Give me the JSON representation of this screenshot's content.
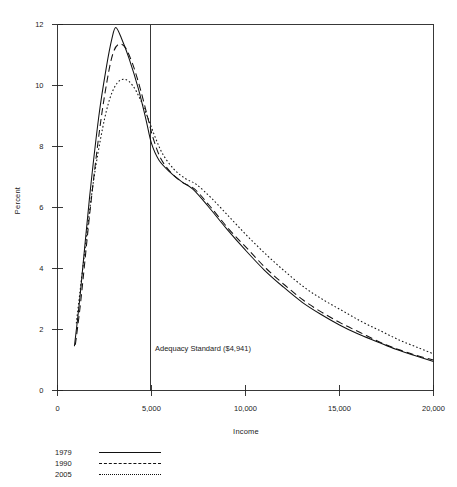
{
  "chart_data": {
    "type": "line",
    "title": "",
    "xlabel": "Income",
    "ylabel": "Percent",
    "xlim": [
      0,
      20000
    ],
    "ylim": [
      0,
      12
    ],
    "grid": false,
    "legend_position": "below-left",
    "x_ticks": [
      {
        "value": 0,
        "label": "0"
      },
      {
        "value": 5000,
        "label": "5,000"
      },
      {
        "value": 10000,
        "label": "10,000"
      },
      {
        "value": 15000,
        "label": "15,000"
      },
      {
        "value": 20000,
        "label": "20,000"
      }
    ],
    "y_ticks": [
      {
        "value": 0,
        "label": "0"
      },
      {
        "value": 2,
        "label": "2"
      },
      {
        "value": 4,
        "label": "4"
      },
      {
        "value": 6,
        "label": "6"
      },
      {
        "value": 8,
        "label": "8"
      },
      {
        "value": 10,
        "label": "10"
      },
      {
        "value": 12,
        "label": "12"
      }
    ],
    "annotations": [
      {
        "name": "adequacy-standard",
        "text": "Adequacy Standard ($4,941)",
        "x": 4941,
        "type": "vertical-line-with-label",
        "label_x": 5300,
        "label_y": 1.45
      }
    ],
    "series": [
      {
        "name": "1979",
        "style": "solid",
        "color": "#111111",
        "points": [
          [
            900,
            1.45
          ],
          [
            1200,
            3.1
          ],
          [
            1700,
            6.3
          ],
          [
            2200,
            9.0
          ],
          [
            2600,
            10.6
          ],
          [
            2900,
            11.55
          ],
          [
            3100,
            11.9
          ],
          [
            3400,
            11.55
          ],
          [
            3800,
            10.9
          ],
          [
            4300,
            9.9
          ],
          [
            4700,
            8.9
          ],
          [
            5000,
            8.1
          ],
          [
            5400,
            7.55
          ],
          [
            6000,
            7.15
          ],
          [
            6600,
            6.85
          ],
          [
            7200,
            6.6
          ],
          [
            8000,
            6.05
          ],
          [
            9000,
            5.3
          ],
          [
            10000,
            4.6
          ],
          [
            11000,
            3.95
          ],
          [
            12000,
            3.4
          ],
          [
            13000,
            2.9
          ],
          [
            14000,
            2.5
          ],
          [
            15000,
            2.15
          ],
          [
            16000,
            1.85
          ],
          [
            17000,
            1.6
          ],
          [
            18000,
            1.35
          ],
          [
            19000,
            1.15
          ],
          [
            20000,
            0.95
          ]
        ]
      },
      {
        "name": "1990",
        "style": "dashed",
        "color": "#111111",
        "points": [
          [
            950,
            1.5
          ],
          [
            1250,
            3.0
          ],
          [
            1750,
            6.0
          ],
          [
            2250,
            8.6
          ],
          [
            2650,
            10.2
          ],
          [
            2950,
            11.05
          ],
          [
            3250,
            11.35
          ],
          [
            3600,
            11.25
          ],
          [
            4000,
            10.7
          ],
          [
            4400,
            9.9
          ],
          [
            4800,
            8.95
          ],
          [
            5100,
            8.25
          ],
          [
            5500,
            7.6
          ],
          [
            6100,
            7.1
          ],
          [
            6700,
            6.8
          ],
          [
            7300,
            6.6
          ],
          [
            8100,
            6.05
          ],
          [
            9100,
            5.3
          ],
          [
            10100,
            4.65
          ],
          [
            11100,
            4.0
          ],
          [
            12100,
            3.45
          ],
          [
            13100,
            2.95
          ],
          [
            14100,
            2.55
          ],
          [
            15100,
            2.2
          ],
          [
            16100,
            1.9
          ],
          [
            17100,
            1.6
          ],
          [
            18100,
            1.35
          ],
          [
            19100,
            1.15
          ],
          [
            20000,
            1.0
          ]
        ]
      },
      {
        "name": "2005",
        "style": "dotted",
        "color": "#111111",
        "points": [
          [
            1000,
            2.2
          ],
          [
            1400,
            4.3
          ],
          [
            1900,
            6.8
          ],
          [
            2400,
            8.6
          ],
          [
            2800,
            9.6
          ],
          [
            3200,
            10.1
          ],
          [
            3600,
            10.2
          ],
          [
            4000,
            10.0
          ],
          [
            4400,
            9.55
          ],
          [
            4800,
            8.95
          ],
          [
            5200,
            8.3
          ],
          [
            5600,
            7.75
          ],
          [
            6200,
            7.25
          ],
          [
            6800,
            6.95
          ],
          [
            7400,
            6.75
          ],
          [
            8200,
            6.3
          ],
          [
            9200,
            5.65
          ],
          [
            10200,
            5.0
          ],
          [
            11200,
            4.4
          ],
          [
            12200,
            3.85
          ],
          [
            13200,
            3.35
          ],
          [
            14200,
            2.95
          ],
          [
            15200,
            2.6
          ],
          [
            16200,
            2.25
          ],
          [
            17200,
            1.95
          ],
          [
            18200,
            1.65
          ],
          [
            19200,
            1.4
          ],
          [
            20000,
            1.2
          ]
        ]
      }
    ],
    "legend": [
      {
        "label": "1979",
        "style": "solid"
      },
      {
        "label": "1990",
        "style": "dashed"
      },
      {
        "label": "2005",
        "style": "dotted"
      }
    ]
  }
}
